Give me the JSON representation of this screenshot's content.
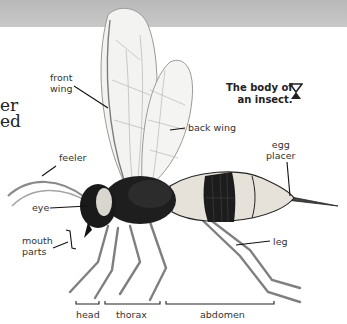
{
  "header_band": {
    "color": "#c0c0c0"
  },
  "cut_off_text": {
    "line1": "er",
    "line2": "ed"
  },
  "caption": {
    "line1": "The body of",
    "line2": "an insect.",
    "icon": "triangle-pointer-icon"
  },
  "labels": {
    "front_wing": {
      "line1": "front",
      "line2": "wing"
    },
    "back_wing": "back wing",
    "feeler": "feeler",
    "eye": "eye",
    "mouth_parts": {
      "line1": "mouth",
      "line2": "parts"
    },
    "egg_placer": {
      "line1": "egg",
      "line2": "placer"
    },
    "leg": "leg"
  },
  "body_sections": [
    {
      "label": "head"
    },
    {
      "label": "thorax"
    },
    {
      "label": "abdomen"
    }
  ],
  "colors": {
    "body_dark": "#1a1a1a",
    "abdomen_pale": "#e4e0d8",
    "wing": "#f2f2f0",
    "leader_line": "#111111"
  }
}
